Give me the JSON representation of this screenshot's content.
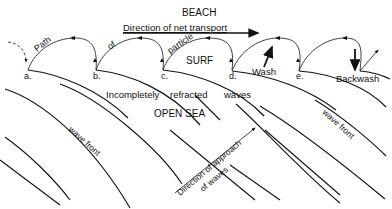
{
  "diagram": {
    "title": "BEACH",
    "net_transport_label": "Direction of net transport",
    "path_words": [
      "Path",
      "of",
      "particle"
    ],
    "zone_labels": {
      "surf": "SURF",
      "open_sea": "OPEN SEA",
      "incomplete": [
        "Incompletely",
        "refracted",
        "waves"
      ]
    },
    "points": [
      "a.",
      "b.",
      "c.",
      "d.",
      "e."
    ],
    "arrows": {
      "wash": "Wash",
      "backwash": "Backwash"
    },
    "wave_front_labels": [
      "wave front",
      "wave front"
    ],
    "approach_label": [
      "Direction of approach",
      "of waves"
    ],
    "colors": {
      "ink": "#111111",
      "background": "#ffffff"
    }
  }
}
